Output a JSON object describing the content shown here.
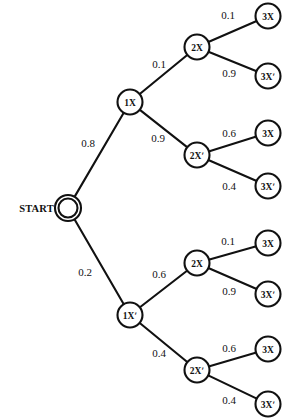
{
  "diagram": {
    "type": "probability-tree",
    "title": "",
    "start_label": "START",
    "nodes": [
      {
        "id": "start",
        "label": "",
        "kind": "start",
        "x": 68,
        "y": 208,
        "r": 9.5,
        "double": true
      },
      {
        "id": "n1x",
        "label": "1X",
        "kind": "decision",
        "x": 130,
        "y": 102,
        "r": 12.5,
        "double": false
      },
      {
        "id": "n1xp",
        "label": "1Xʹ",
        "kind": "decision",
        "x": 130,
        "y": 315,
        "r": 12.5,
        "double": false
      },
      {
        "id": "n2x_a",
        "label": "2X",
        "kind": "decision",
        "x": 197,
        "y": 47,
        "r": 12.5,
        "double": false
      },
      {
        "id": "n2xp_a",
        "label": "2Xʹ",
        "kind": "decision",
        "x": 197,
        "y": 155,
        "r": 12.5,
        "double": false
      },
      {
        "id": "n2x_b",
        "label": "2X",
        "kind": "decision",
        "x": 197,
        "y": 263,
        "r": 12.5,
        "double": false
      },
      {
        "id": "n2xp_b",
        "label": "2Xʹ",
        "kind": "decision",
        "x": 197,
        "y": 370,
        "r": 12.5,
        "double": false
      },
      {
        "id": "leaf1",
        "label": "3X",
        "kind": "leaf",
        "x": 268,
        "y": 16,
        "r": 12.5,
        "double": false
      },
      {
        "id": "leaf2",
        "label": "3Xʹ",
        "kind": "leaf",
        "x": 268,
        "y": 76,
        "r": 12.5,
        "double": false
      },
      {
        "id": "leaf3",
        "label": "3X",
        "kind": "leaf",
        "x": 268,
        "y": 133,
        "r": 12.5,
        "double": false
      },
      {
        "id": "leaf4",
        "label": "3Xʹ",
        "kind": "leaf",
        "x": 268,
        "y": 186,
        "r": 12.5,
        "double": false
      },
      {
        "id": "leaf5",
        "label": "3X",
        "kind": "leaf",
        "x": 268,
        "y": 243,
        "r": 12.5,
        "double": false
      },
      {
        "id": "leaf6",
        "label": "3Xʹ",
        "kind": "leaf",
        "x": 268,
        "y": 294,
        "r": 12.5,
        "double": false
      },
      {
        "id": "leaf7",
        "label": "3X",
        "kind": "leaf",
        "x": 268,
        "y": 349,
        "r": 12.5,
        "double": false
      },
      {
        "id": "leaf8",
        "label": "3Xʹ",
        "kind": "leaf",
        "x": 268,
        "y": 404,
        "r": 12.5,
        "double": false
      }
    ],
    "edges": [
      {
        "id": "e-start-1x",
        "from": "start",
        "to": "n1x",
        "probability": "0.8",
        "label_x": 88,
        "label_y": 143
      },
      {
        "id": "e-start-1xp",
        "from": "start",
        "to": "n1xp",
        "probability": "0.2",
        "label_x": 85,
        "label_y": 272
      },
      {
        "id": "e-1x-2x",
        "from": "n1x",
        "to": "n2x_a",
        "probability": "0.1",
        "label_x": 159,
        "label_y": 64
      },
      {
        "id": "e-1x-2xp",
        "from": "n1x",
        "to": "n2xp_a",
        "probability": "0.9",
        "label_x": 158,
        "label_y": 138
      },
      {
        "id": "e-2x-leaf1",
        "from": "n2x_a",
        "to": "leaf1",
        "probability": "0.1",
        "label_x": 228,
        "label_y": 15
      },
      {
        "id": "e-2x-leaf2",
        "from": "n2x_a",
        "to": "leaf2",
        "probability": "0.9",
        "label_x": 229,
        "label_y": 73
      },
      {
        "id": "e-2xp-leaf3",
        "from": "n2xp_a",
        "to": "leaf3",
        "probability": "0.6",
        "label_x": 229,
        "label_y": 133
      },
      {
        "id": "e-2xp-leaf4",
        "from": "n2xp_a",
        "to": "leaf4",
        "probability": "0.4",
        "label_x": 229,
        "label_y": 186
      },
      {
        "id": "e-1xp-2x",
        "from": "n1xp",
        "to": "n2x_b",
        "probability": "0.6",
        "label_x": 159,
        "label_y": 274
      },
      {
        "id": "e-1xp-2xp",
        "from": "n1xp",
        "to": "n2xp_b",
        "probability": "0.4",
        "label_x": 159,
        "label_y": 353
      },
      {
        "id": "e-2xb-leaf5",
        "from": "n2x_b",
        "to": "leaf5",
        "probability": "0.1",
        "label_x": 228,
        "label_y": 241
      },
      {
        "id": "e-2xb-leaf6",
        "from": "n2x_b",
        "to": "leaf6",
        "probability": "0.9",
        "label_x": 229,
        "label_y": 291
      },
      {
        "id": "e-2xpb-leaf7",
        "from": "n2xp_b",
        "to": "leaf7",
        "probability": "0.6",
        "label_x": 229,
        "label_y": 348
      },
      {
        "id": "e-2xpb-leaf8",
        "from": "n2xp_b",
        "to": "leaf8",
        "probability": "0.4",
        "label_x": 229,
        "label_y": 400
      }
    ],
    "colors": {
      "stroke": "#111111",
      "node_fill": "#ffffff",
      "background": "#ffffff",
      "text": "#111111"
    }
  }
}
